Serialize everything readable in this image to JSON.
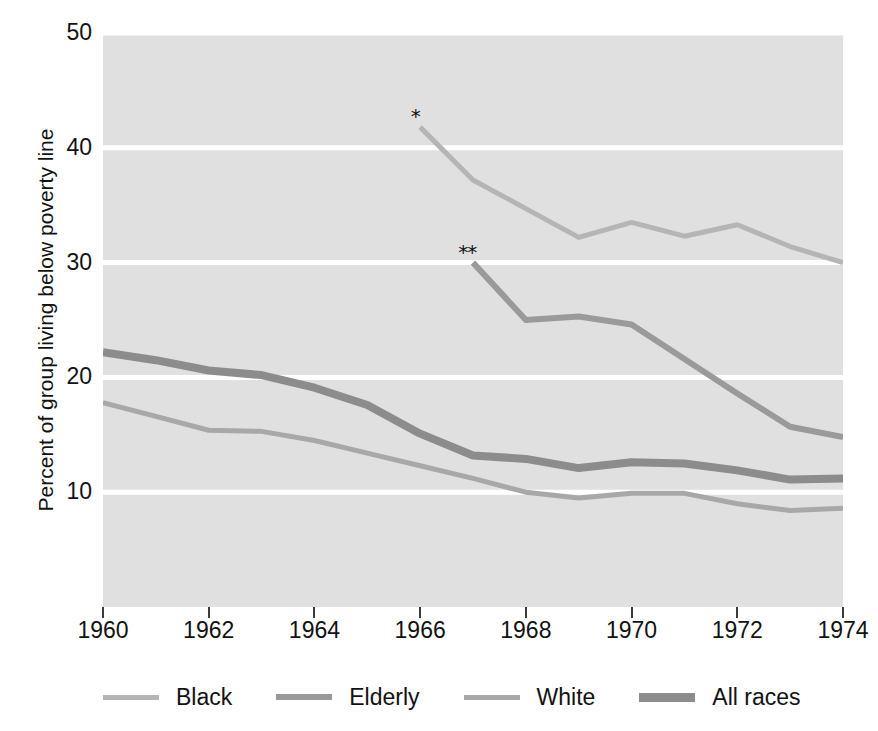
{
  "chart_data": {
    "type": "line",
    "title": "",
    "xlabel": "",
    "ylabel": "Percent of group living below poverty line",
    "xlim": [
      1960,
      1974
    ],
    "ylim": [
      0,
      50
    ],
    "yticks": [
      50,
      40,
      30,
      20,
      10
    ],
    "xticks": [
      1960,
      1962,
      1964,
      1966,
      1968,
      1970,
      1972,
      1974
    ],
    "grid": "horizontal-white-lines-on-gray-panel",
    "legend_position": "below-plot",
    "x": [
      1960,
      1961,
      1962,
      1963,
      1964,
      1965,
      1966,
      1967,
      1968,
      1969,
      1970,
      1971,
      1972,
      1973,
      1974
    ],
    "series": [
      {
        "name": "Black",
        "color": "#b5b5b5",
        "width": 5,
        "marker_note": "*",
        "x": [
          1966,
          1967,
          1968,
          1969,
          1970,
          1971,
          1972,
          1973,
          1974
        ],
        "values": [
          41.8,
          37.2,
          34.7,
          32.2,
          33.5,
          32.3,
          33.3,
          31.4,
          30.0
        ]
      },
      {
        "name": "Elderly",
        "color": "#9a9a9a",
        "width": 6,
        "marker_note": "**",
        "x": [
          1967,
          1968,
          1969,
          1970,
          1971,
          1972,
          1973,
          1974
        ],
        "values": [
          30.0,
          25.0,
          25.3,
          24.6,
          21.6,
          18.6,
          15.7,
          14.8
        ]
      },
      {
        "name": "White",
        "color": "#a8a8a8",
        "width": 5,
        "marker_note": "",
        "x": [
          1960,
          1961,
          1962,
          1963,
          1964,
          1965,
          1966,
          1967,
          1968,
          1969,
          1970,
          1971,
          1972,
          1973,
          1974
        ],
        "values": [
          17.8,
          16.6,
          15.4,
          15.3,
          14.5,
          13.4,
          12.3,
          11.2,
          10.0,
          9.5,
          9.9,
          9.9,
          9.0,
          8.4,
          8.6
        ]
      },
      {
        "name": "All races",
        "color": "#8c8c8c",
        "width": 8,
        "marker_note": "",
        "x": [
          1960,
          1961,
          1962,
          1963,
          1964,
          1965,
          1966,
          1967,
          1968,
          1969,
          1970,
          1971,
          1972,
          1973,
          1974
        ],
        "values": [
          22.2,
          21.5,
          20.6,
          20.2,
          19.1,
          17.6,
          15.1,
          13.2,
          12.9,
          12.1,
          12.6,
          12.5,
          11.9,
          11.1,
          11.2
        ]
      }
    ],
    "annotations": [
      {
        "text": "*",
        "x": 1965.82,
        "y": 43.6,
        "series": "Black"
      },
      {
        "text": "**",
        "x": 1966.72,
        "y": 31.8,
        "series": "Elderly"
      }
    ]
  },
  "axis": {
    "ylabel": "Percent of group living below poverty line",
    "ytick_labels": [
      "50",
      "40",
      "30",
      "20",
      "10"
    ],
    "xtick_labels": [
      "1960",
      "1962",
      "1964",
      "1966",
      "1968",
      "1970",
      "1972",
      "1974"
    ]
  },
  "legend": {
    "items": [
      {
        "label": "Black",
        "color": "#b5b5b5",
        "thickness": 5
      },
      {
        "label": "Elderly",
        "color": "#9a9a9a",
        "thickness": 6
      },
      {
        "label": "White",
        "color": "#a8a8a8",
        "thickness": 5
      },
      {
        "label": "All races",
        "color": "#8c8c8c",
        "thickness": 9
      }
    ]
  },
  "colors": {
    "panel_background": "#e0e0e0",
    "gridline": "#ffffff",
    "page_background": "#ffffff",
    "text": "#121212"
  }
}
